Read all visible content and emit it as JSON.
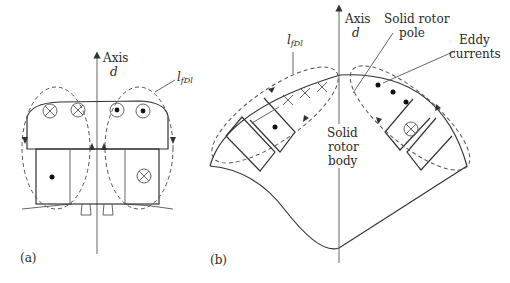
{
  "figure_a": {
    "panel_label": "(a)",
    "axis_label_line1": "Axis",
    "axis_label_line2": "d",
    "flux_label_main": "l",
    "flux_label_sub": "fDl",
    "symbols": {
      "pole_left": [
        "cross-in",
        "cross-in"
      ],
      "pole_right": [
        "dot-out",
        "dot-out"
      ],
      "winding_left": "dot",
      "winding_right": "cross-in"
    }
  },
  "figure_b": {
    "panel_label": "(b)",
    "axis_label_line1": "Axis",
    "axis_label_line2": "d",
    "flux_label_main": "l",
    "flux_label_sub": "fDl",
    "solid_rotor_pole_line1": "Solid rotor",
    "solid_rotor_pole_line2": "pole",
    "eddy_currents_line1": "Eddy",
    "eddy_currents_line2": "currents",
    "solid_rotor_body_line1": "Solid",
    "solid_rotor_body_line2": "rotor",
    "solid_rotor_body_line3": "body",
    "symbols": {
      "pole_left_eddy": [
        "x",
        "x",
        "x"
      ],
      "pole_right_eddy": [
        "dot",
        "dot",
        "dot"
      ],
      "winding_left": "dot",
      "winding_right": "cross-in"
    }
  }
}
